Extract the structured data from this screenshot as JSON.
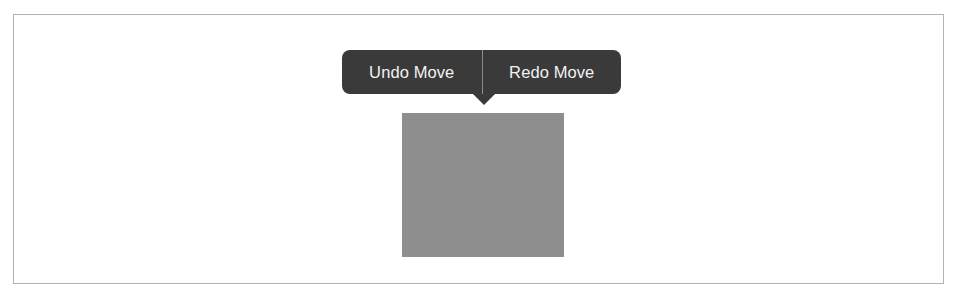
{
  "screenshot": {
    "width": 961,
    "height": 303,
    "background_color": "#ffffff"
  },
  "figure": {
    "frame_border_color": "#b3b3b3",
    "canvas_background": "#ffffff"
  },
  "action_bar": {
    "background_color": "#3a3a3a",
    "text_color": "#f2f2f2",
    "divider_color": "#8a8a8a",
    "undo_label": "Undo Move",
    "redo_label": "Redo Move",
    "pointer_direction": "down"
  },
  "shape": {
    "name": "draggable-block",
    "fill_color": "#8e8e8e"
  }
}
